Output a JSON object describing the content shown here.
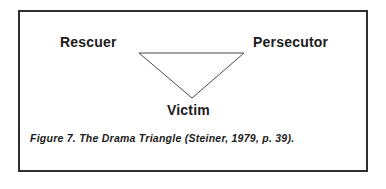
{
  "figure": {
    "caption": "Figure 7.  The Drama Triangle (Steiner, 1979, p. 39).",
    "border_color": "#2e2e2e",
    "background_color": "#ffffff",
    "text_color": "#1b1b1b"
  },
  "diagram": {
    "type": "drama-triangle",
    "shape": "inverted-triangle",
    "stroke_color": "#4a4a4a",
    "stroke_width": 1,
    "roles": [
      {
        "id": "rescuer",
        "label": "Rescuer",
        "position": "top-left"
      },
      {
        "id": "persecutor",
        "label": "Persecutor",
        "position": "top-right"
      },
      {
        "id": "victim",
        "label": "Victim",
        "position": "bottom-center"
      }
    ],
    "vertices": [
      {
        "role": "rescuer",
        "x": 139,
        "y": 53
      },
      {
        "role": "persecutor",
        "x": 244,
        "y": 53
      },
      {
        "role": "victim",
        "x": 192,
        "y": 98
      }
    ]
  }
}
